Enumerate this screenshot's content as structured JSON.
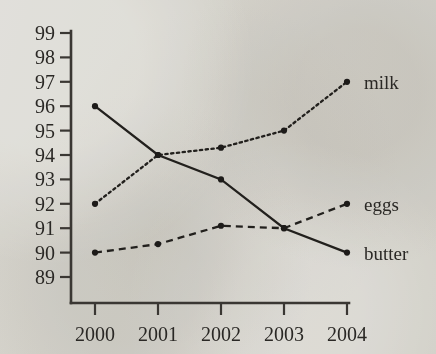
{
  "chart_data": {
    "type": "line",
    "title": "",
    "subtitle": "",
    "xlabel": "",
    "ylabel": "",
    "categories": [
      "2000",
      "2001",
      "2002",
      "2003",
      "2004"
    ],
    "x": [
      2000,
      2001,
      2002,
      2003,
      2004
    ],
    "xlim": [
      1999.6,
      2004.4
    ],
    "ylim": [
      88.4,
      99.2
    ],
    "yticks": [
      89,
      90,
      91,
      92,
      93,
      94,
      95,
      96,
      97,
      98,
      99
    ],
    "ytick_labels": [
      "89",
      "90",
      "91",
      "92",
      "93",
      "94",
      "95",
      "96",
      "97",
      "98",
      "99"
    ],
    "xticks": [
      2000,
      2001,
      2002,
      2003,
      2004
    ],
    "xtick_labels": [
      "2000",
      "2001",
      "2002",
      "2003",
      "2004"
    ],
    "grid": false,
    "legend_position": "right-inline-end-of-line",
    "series": [
      {
        "name": "milk",
        "label": "milk",
        "linestyle": "dotted",
        "color": "#22201d",
        "marker": "circle",
        "values": [
          92,
          94,
          94.3,
          95,
          97
        ]
      },
      {
        "name": "eggs",
        "label": "eggs",
        "linestyle": "dashed",
        "color": "#22201d",
        "marker": "circle",
        "values": [
          90,
          90.35,
          91.1,
          91,
          92
        ]
      },
      {
        "name": "butter",
        "label": "butter",
        "linestyle": "solid",
        "color": "#22201d",
        "marker": "circle",
        "values": [
          96,
          94,
          93,
          91,
          90
        ]
      }
    ]
  },
  "axis": {
    "y_tick_labels": [
      "99",
      "98",
      "97",
      "96",
      "95",
      "94",
      "93",
      "92",
      "91",
      "90",
      "89"
    ],
    "x_tick_labels": [
      "2000",
      "2001",
      "2002",
      "2003",
      "2004"
    ]
  },
  "legend": {
    "items": [
      {
        "label": "milk"
      },
      {
        "label": "eggs"
      },
      {
        "label": "butter"
      }
    ]
  },
  "colors": {
    "background": "#e9e8e4",
    "ink": "#22201d",
    "axis": "#3a3733"
  }
}
